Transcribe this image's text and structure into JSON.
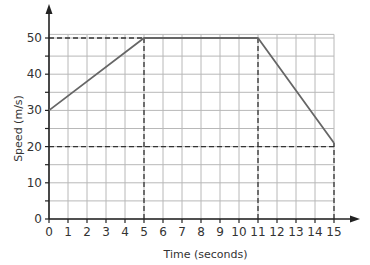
{
  "chart_data": {
    "type": "line",
    "title": "",
    "xlabel": "Time (seconds)",
    "ylabel": "Speed (m/s)",
    "xlim": [
      0,
      15
    ],
    "ylim": [
      0,
      50
    ],
    "x_ticks": [
      0,
      1,
      2,
      3,
      4,
      5,
      6,
      7,
      8,
      9,
      10,
      11,
      12,
      13,
      14,
      15
    ],
    "y_ticks": [
      0,
      10,
      20,
      30,
      40,
      50
    ],
    "grid": true,
    "grid_x_step": 1,
    "grid_y_step": 5,
    "legend": null,
    "series": [
      {
        "name": "speed",
        "x": [
          0,
          5,
          11,
          15
        ],
        "y": [
          30,
          50,
          50,
          21
        ],
        "color": "#666666"
      }
    ],
    "reference_lines": [
      {
        "orientation": "horizontal",
        "y": 50,
        "from_x": 0,
        "to_x": 5,
        "style": "dashed"
      },
      {
        "orientation": "horizontal",
        "y": 20,
        "from_x": 0,
        "to_x": 15,
        "style": "dashed"
      },
      {
        "orientation": "vertical",
        "x": 5,
        "from_y": 0,
        "to_y": 50,
        "style": "dashed"
      },
      {
        "orientation": "vertical",
        "x": 11,
        "from_y": 0,
        "to_y": 50,
        "style": "dashed"
      },
      {
        "orientation": "vertical",
        "x": 15,
        "from_y": 0,
        "to_y": 21,
        "style": "dashed"
      }
    ]
  },
  "colors": {
    "grid": "#b8b8b8",
    "axis": "#222222",
    "line": "#666666",
    "dashed": "#333333",
    "background": "#ffffff"
  },
  "layout": {
    "x0": 49,
    "x_scale": 19.0,
    "y0": 219,
    "y_scale": 3.62,
    "grid_top_value": 51
  }
}
